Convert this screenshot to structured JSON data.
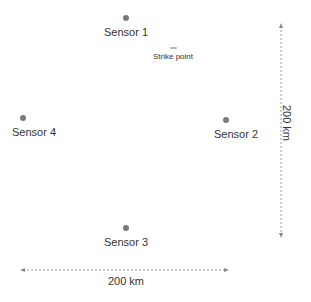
{
  "sensors": [
    {
      "id": 1,
      "label": "Sensor 1",
      "x": 126,
      "y": 18
    },
    {
      "id": 2,
      "label": "Sensor 2",
      "x": 226,
      "y": 120
    },
    {
      "id": 3,
      "label": "Sensor 3",
      "x": 126,
      "y": 228
    },
    {
      "id": 4,
      "label": "Sensor 4",
      "x": 23,
      "y": 118
    }
  ],
  "strike_point": {
    "label": "Strike point",
    "x": 173,
    "y": 48
  },
  "scale": {
    "horizontal_label": "200 km",
    "vertical_label": "200 km"
  },
  "colors": {
    "dot": "#7a7a7a",
    "arrow": "#9a9a9a",
    "strike": "#b8b8b8",
    "text": "#333333"
  }
}
